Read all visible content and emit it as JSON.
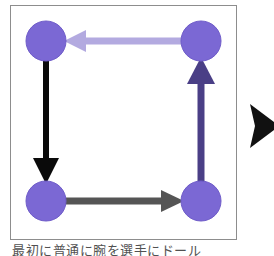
{
  "figure": {
    "background_color": "#ffffff",
    "panel": {
      "border_color": "#8d8d8d",
      "fill_color": "#ffffff"
    }
  },
  "caption": {
    "text": "最初に普通に腕を選手にドール"
  },
  "marker": {
    "name": "next-triangle",
    "color": "#111111",
    "direction": "right"
  },
  "colors": {
    "node_fill": "#7b68d4",
    "node_stroke": "#6f5cc9",
    "edge_top": "#b3aae0",
    "edge_left": "#0a0a0a",
    "edge_bottom": "#555555",
    "edge_right": "#4a3f86",
    "panel_border": "#8d8d8d"
  },
  "graph": {
    "node_radius": 20,
    "nodes": [
      {
        "id": "n-top-left",
        "label": "",
        "cx": 35,
        "cy": 35
      },
      {
        "id": "n-top-right",
        "label": "",
        "cx": 190,
        "cy": 35
      },
      {
        "id": "n-bottom-left",
        "label": "",
        "cx": 35,
        "cy": 195
      },
      {
        "id": "n-bottom-right",
        "label": "",
        "cx": 190,
        "cy": 195
      }
    ],
    "edges": [
      {
        "id": "edge-top",
        "from": "n-top-right",
        "to": "n-top-left",
        "direction": "left",
        "color": "#b3aae0",
        "width": 7
      },
      {
        "id": "edge-left",
        "from": "n-top-left",
        "to": "n-bottom-left",
        "direction": "down",
        "color": "#0a0a0a",
        "width": 6
      },
      {
        "id": "edge-bottom",
        "from": "n-bottom-left",
        "to": "n-bottom-right",
        "direction": "right",
        "color": "#555555",
        "width": 7
      },
      {
        "id": "edge-right",
        "from": "n-bottom-right",
        "to": "n-top-right",
        "direction": "up",
        "color": "#4a3f86",
        "width": 7
      }
    ]
  }
}
